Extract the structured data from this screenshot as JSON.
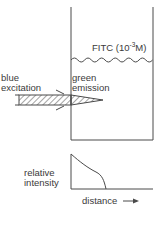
{
  "figure": {
    "solution_label": "FITC (10",
    "solution_exponent": "-3",
    "solution_unit": "M)",
    "excitation_label_line1": "blue",
    "excitation_label_line2": "excitation",
    "emission_label_line1": "green",
    "emission_label_line2": "emission",
    "graph_ylabel_line1": "relative",
    "graph_ylabel_line2": "intensity",
    "graph_xlabel": "distance",
    "xlabel_arrow_icon": "right-arrow-icon"
  },
  "colors": {
    "line": "#4a4a4a",
    "text": "#3a3a3a",
    "background": "#ffffff"
  }
}
